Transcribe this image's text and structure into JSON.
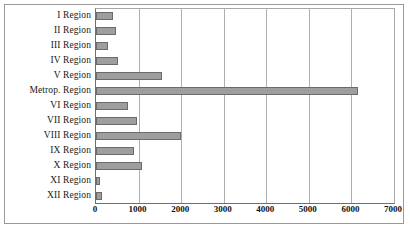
{
  "chart_data": {
    "type": "bar",
    "orientation": "horizontal",
    "title": "",
    "subtitle": "",
    "xlabel": "",
    "ylabel": "",
    "xlim": [
      0,
      7000
    ],
    "ylim": null,
    "grid": true,
    "legend": null,
    "legend_position": "none",
    "xticks": [
      0,
      1000,
      2000,
      3000,
      4000,
      5000,
      6000,
      7000
    ],
    "xtick_labels": [
      "0",
      "1000",
      "2000",
      "3000",
      "4000",
      "5000",
      "6000",
      "7000"
    ],
    "categories": [
      "I Region",
      "II Region",
      "III Region",
      "IV Region",
      "V Region",
      "Metrop. Region",
      "VI Region",
      "VII Region",
      "VIII Region",
      "IX Region",
      "X Region",
      "XI Region",
      "XII Region"
    ],
    "values": [
      400,
      470,
      280,
      520,
      1550,
      6150,
      750,
      960,
      2000,
      890,
      1080,
      100,
      140
    ],
    "series": [
      {
        "name": "",
        "values": [
          400,
          470,
          280,
          520,
          1550,
          6150,
          750,
          960,
          2000,
          890,
          1080,
          100,
          140
        ]
      }
    ],
    "colors": {
      "bar_fill": "#9e9e9e",
      "bar_border": "#6b6b6b",
      "gridline": "#aeaeae",
      "axis": "#6f6f6f",
      "frame": "#9a9a9a",
      "background": "#ffffff",
      "text": "#111111"
    }
  }
}
